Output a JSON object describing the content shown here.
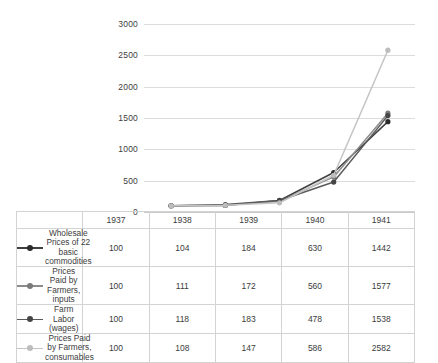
{
  "chart_data": {
    "type": "line",
    "title": "",
    "subtitle": "",
    "xlabel": "",
    "ylabel": "",
    "categories": [
      "1937",
      "1938",
      "1939",
      "1940",
      "1941"
    ],
    "ylim": [
      0,
      3000
    ],
    "y_ticks": [
      0,
      500,
      1000,
      1500,
      2000,
      2500,
      3000
    ],
    "y_tick_labels": [
      "0",
      "500",
      "1000",
      "1500",
      "2000",
      "2500",
      "3000"
    ],
    "grid": true,
    "legend_position": "table-below",
    "markers": true,
    "series": [
      {
        "name": "Wholesale Prices of 22 basic commodities",
        "values": [
          100,
          104,
          184,
          630,
          1442
        ],
        "color": "#3f3f3f",
        "marker_color": "#2b2b2b"
      },
      {
        "name": "Prices Paid by Farmers, inputs",
        "values": [
          100,
          111,
          172,
          560,
          1577
        ],
        "color": "#8c8c8c",
        "marker_color": "#7a7a7a"
      },
      {
        "name": "Farm Labor (wages)",
        "values": [
          100,
          118,
          183,
          478,
          1538
        ],
        "color": "#5a5a5a",
        "marker_color": "#454545"
      },
      {
        "name": "Prices Paid by Farmers, consumables",
        "values": [
          100,
          108,
          147,
          586,
          2582
        ],
        "color": "#c4c4c4",
        "marker_color": "#bdbdbd"
      }
    ]
  },
  "table": {
    "corner_label": "",
    "year_headers": [
      "1937",
      "1938",
      "1939",
      "1940",
      "1941"
    ],
    "rows": [
      {
        "label": "Wholesale Prices of 22 basic commodities",
        "values": [
          "100",
          "104",
          "184",
          "630",
          "1442"
        ]
      },
      {
        "label": "Prices Paid by Farmers, inputs",
        "values": [
          "100",
          "111",
          "172",
          "560",
          "1577"
        ]
      },
      {
        "label": "Farm Labor (wages)",
        "values": [
          "100",
          "118",
          "183",
          "478",
          "1538"
        ]
      },
      {
        "label": "Prices Paid by Farmers, consumables",
        "values": [
          "100",
          "108",
          "147",
          "586",
          "2582"
        ]
      }
    ]
  },
  "colors": {
    "gridline": "#dcdcdc",
    "axis": "#c9c9c9",
    "table_border": "#d3d3d3",
    "text": "#3c3c3c",
    "background": "#ffffff"
  }
}
